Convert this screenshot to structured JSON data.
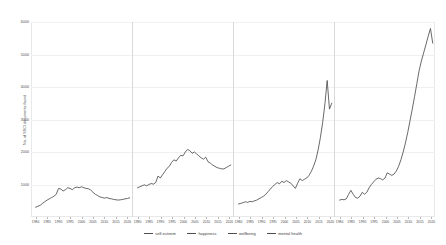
{
  "chart_data": {
    "type": "line",
    "title": "",
    "subtitle": "",
    "xlabel": "",
    "ylabel": "No. of SSCI documents found",
    "ylim": [
      0,
      6000
    ],
    "yticks": [
      1000,
      2000,
      3000,
      4000,
      5000,
      6000
    ],
    "ytick_labels": [
      "1000",
      "2000",
      "3000",
      "4000",
      "5000",
      "6000"
    ],
    "grid": true,
    "faceted": true,
    "legend_position": "bottom",
    "xticks": [
      1980,
      1985,
      1990,
      1995,
      2000,
      2005,
      2010,
      2015,
      2020
    ],
    "xtick_labels": [
      "1980",
      "1985",
      "1990",
      "1995",
      "2000",
      "2005",
      "2010",
      "2015",
      "2020"
    ],
    "xlim": [
      1978,
      2022
    ],
    "series": [
      {
        "name": "self-esteem",
        "color": "#4d4d4d",
        "x": [
          1980,
          1981,
          1982,
          1983,
          1984,
          1985,
          1986,
          1987,
          1988,
          1989,
          1990,
          1991,
          1992,
          1993,
          1994,
          1995,
          1996,
          1997,
          1998,
          1999,
          2000,
          2001,
          2002,
          2003,
          2004,
          2005,
          2006,
          2007,
          2008,
          2009,
          2010,
          2011,
          2012,
          2013,
          2014,
          2015,
          2016,
          2017,
          2018,
          2019,
          2020,
          2021
        ],
        "values": [
          300,
          330,
          360,
          420,
          470,
          520,
          560,
          600,
          640,
          700,
          880,
          860,
          800,
          840,
          900,
          880,
          840,
          900,
          920,
          900,
          930,
          900,
          880,
          870,
          830,
          760,
          700,
          660,
          620,
          600,
          580,
          600,
          570,
          560,
          540,
          530,
          520,
          530,
          540,
          560,
          570,
          590
        ]
      },
      {
        "name": "happiness",
        "color": "#4d4d4d",
        "x": [
          1980,
          1981,
          1982,
          1983,
          1984,
          1985,
          1986,
          1987,
          1988,
          1989,
          1990,
          1991,
          1992,
          1993,
          1994,
          1995,
          1996,
          1997,
          1998,
          1999,
          2000,
          2001,
          2002,
          2003,
          2004,
          2005,
          2006,
          2007,
          2008,
          2009,
          2010,
          2011,
          2012,
          2013,
          2014,
          2015,
          2016,
          2017,
          2018,
          2019,
          2020,
          2021
        ],
        "values": [
          900,
          930,
          960,
          990,
          960,
          1000,
          1030,
          1010,
          1060,
          1260,
          1200,
          1300,
          1400,
          1500,
          1560,
          1680,
          1760,
          1720,
          1820,
          1900,
          1880,
          2000,
          2080,
          2040,
          1960,
          2000,
          1940,
          1880,
          1820,
          1780,
          1840,
          1700,
          1660,
          1600,
          1560,
          1520,
          1500,
          1480,
          1480,
          1520,
          1560,
          1600
        ]
      },
      {
        "name": "wellbeing",
        "color": "#4d4d4d",
        "x": [
          1980,
          1981,
          1982,
          1983,
          1984,
          1985,
          1986,
          1987,
          1988,
          1989,
          1990,
          1991,
          1992,
          1993,
          1994,
          1995,
          1996,
          1997,
          1998,
          1999,
          2000,
          2001,
          2002,
          2003,
          2004,
          2005,
          2006,
          2007,
          2008,
          2009,
          2010,
          2011,
          2012,
          2013,
          2014,
          2015,
          2016,
          2017,
          2018,
          2019,
          2020,
          2021
        ],
        "values": [
          400,
          420,
          440,
          470,
          450,
          480,
          470,
          500,
          520,
          560,
          600,
          640,
          700,
          780,
          860,
          940,
          1000,
          1060,
          1020,
          1100,
          1060,
          1120,
          1080,
          1040,
          960,
          880,
          1040,
          1180,
          1120,
          1160,
          1200,
          1280,
          1400,
          1560,
          1760,
          2060,
          2440,
          2900,
          3480,
          4200,
          3320,
          3500
        ]
      },
      {
        "name": "mental health",
        "color": "#4d4d4d",
        "x": [
          1980,
          1981,
          1982,
          1983,
          1984,
          1985,
          1986,
          1987,
          1988,
          1989,
          1990,
          1991,
          1992,
          1993,
          1994,
          1995,
          1996,
          1997,
          1998,
          1999,
          2000,
          2001,
          2002,
          2003,
          2004,
          2005,
          2006,
          2007,
          2008,
          2009,
          2010,
          2011,
          2012,
          2013,
          2014,
          2015,
          2016,
          2017,
          2018,
          2019,
          2020,
          2021
        ],
        "values": [
          520,
          540,
          530,
          560,
          700,
          820,
          700,
          600,
          580,
          640,
          760,
          700,
          760,
          900,
          1000,
          1080,
          1160,
          1200,
          1180,
          1140,
          1200,
          1360,
          1320,
          1280,
          1320,
          1420,
          1560,
          1760,
          2000,
          2280,
          2600,
          2960,
          3320,
          3700,
          4100,
          4500,
          4800,
          5050,
          5300,
          5560,
          5800,
          5350
        ]
      }
    ]
  },
  "legend": {
    "items": [
      {
        "label": "self-esteem",
        "color": "#4d4d4d"
      },
      {
        "label": "happiness",
        "color": "#4d4d4d"
      },
      {
        "label": "wellbeing",
        "color": "#4d4d4d"
      },
      {
        "label": "mental health",
        "color": "#4d4d4d"
      }
    ]
  }
}
